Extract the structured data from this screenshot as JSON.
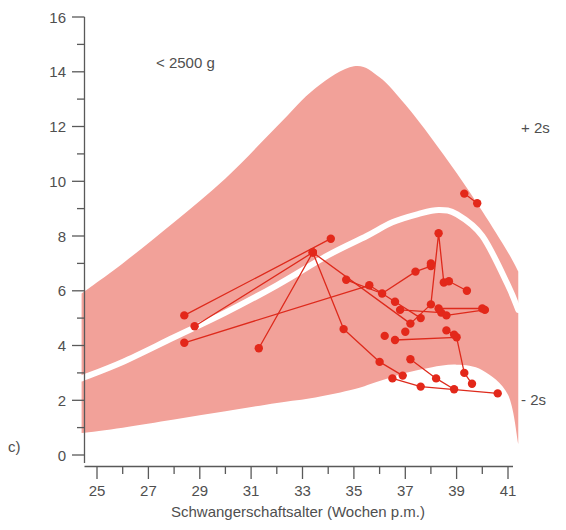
{
  "chart_data": {
    "type": "scatter",
    "title": "",
    "annotation_group_label": "< 2500 g",
    "panel_label": "c)",
    "xlabel": "Schwangerschaftsalter (Wochen p.m.)",
    "ylabel": "",
    "xlim": [
      24.2,
      41.6
    ],
    "ylim": [
      0,
      16
    ],
    "xticks": [
      25,
      26,
      27,
      28,
      29,
      30,
      31,
      32,
      33,
      34,
      35,
      36,
      37,
      38,
      39,
      40,
      41
    ],
    "xtick_labels": [
      "25",
      "",
      "27",
      "",
      "29",
      "",
      "31",
      "",
      "33",
      "",
      "35",
      "",
      "37",
      "",
      "39",
      "",
      "41"
    ],
    "yticks": [
      0,
      1,
      2,
      3,
      4,
      5,
      6,
      7,
      8,
      9,
      10,
      11,
      12,
      13,
      14,
      15,
      16
    ],
    "ytick_labels": [
      "0",
      "",
      "2",
      "",
      "4",
      "",
      "6",
      "",
      "8",
      "",
      "10",
      "",
      "12",
      "",
      "14",
      "",
      "16"
    ],
    "grid": false,
    "legend_position": "none",
    "band_color": "#f2a199",
    "mean_line_color": "#ffffff",
    "series_color": "#e3281a",
    "reference_band": {
      "name": "Normbereich (+2s / -2s)",
      "upper_label": "+ 2s",
      "lower_label": "- 2s",
      "x": [
        24.4,
        26.0,
        28.0,
        30.0,
        32.0,
        33.5,
        35.0,
        36.0,
        37.0,
        38.0,
        39.0,
        40.0,
        41.0,
        41.4
      ],
      "upper": [
        5.9,
        7.0,
        8.5,
        10.1,
        12.0,
        13.4,
        14.2,
        13.8,
        12.8,
        11.6,
        10.3,
        8.9,
        7.4,
        6.7
      ],
      "lower": [
        0.8,
        1.0,
        1.3,
        1.6,
        1.9,
        2.1,
        2.4,
        2.7,
        3.0,
        3.2,
        3.3,
        3.1,
        2.2,
        0.4
      ]
    },
    "mean_curve": {
      "name": "Mittelwert",
      "x": [
        24.4,
        26.0,
        28.0,
        30.0,
        32.0,
        34.0,
        35.5,
        36.5,
        37.5,
        38.3,
        39.0,
        40.0,
        41.0,
        41.4
      ],
      "y": [
        2.8,
        3.4,
        4.3,
        5.2,
        6.2,
        7.3,
        8.0,
        8.5,
        8.8,
        8.95,
        8.8,
        8.0,
        6.2,
        5.3
      ]
    },
    "series": [
      {
        "name": "patient-1",
        "points": [
          [
            28.4,
            5.1
          ],
          [
            34.1,
            7.9
          ]
        ]
      },
      {
        "name": "patient-2",
        "points": [
          [
            28.8,
            4.7
          ],
          [
            33.4,
            7.4
          ]
        ]
      },
      {
        "name": "patient-3",
        "points": [
          [
            28.4,
            4.1
          ],
          [
            35.6,
            6.2
          ],
          [
            36.6,
            5.6
          ],
          [
            37.6,
            5.0
          ]
        ]
      },
      {
        "name": "patient-4",
        "points": [
          [
            31.3,
            3.9
          ],
          [
            33.4,
            7.4
          ],
          [
            34.6,
            4.6
          ],
          [
            36.0,
            3.4
          ],
          [
            36.9,
            2.9
          ]
        ]
      },
      {
        "name": "patient-5",
        "points": [
          [
            33.4,
            7.4
          ],
          [
            37.2,
            4.8
          ],
          [
            38.0,
            5.5
          ],
          [
            38.3,
            8.1
          ],
          [
            38.5,
            6.3
          ]
        ]
      },
      {
        "name": "patient-6",
        "points": [
          [
            34.7,
            6.4
          ],
          [
            36.1,
            5.9
          ],
          [
            37.4,
            6.7
          ],
          [
            38.0,
            6.9
          ]
        ]
      },
      {
        "name": "patient-7",
        "points": [
          [
            36.8,
            5.3
          ],
          [
            38.4,
            5.2
          ],
          [
            38.6,
            5.1
          ],
          [
            40.1,
            5.3
          ]
        ]
      },
      {
        "name": "patient-8",
        "points": [
          [
            38.3,
            5.35
          ],
          [
            40.0,
            5.35
          ]
        ]
      },
      {
        "name": "patient-9",
        "points": [
          [
            36.6,
            4.2
          ],
          [
            39.0,
            4.3
          ],
          [
            39.3,
            3.0
          ],
          [
            39.6,
            2.6
          ]
        ]
      },
      {
        "name": "patient-10",
        "points": [
          [
            37.2,
            3.5
          ],
          [
            38.2,
            2.8
          ],
          [
            38.9,
            2.4
          ]
        ]
      },
      {
        "name": "patient-11",
        "points": [
          [
            36.5,
            2.8
          ],
          [
            37.6,
            2.5
          ],
          [
            40.6,
            2.25
          ]
        ]
      },
      {
        "name": "patient-12",
        "points": [
          [
            38.6,
            4.55
          ],
          [
            38.9,
            4.4
          ]
        ]
      },
      {
        "name": "patient-13",
        "points": [
          [
            39.3,
            9.55
          ],
          [
            39.8,
            9.2
          ]
        ]
      },
      {
        "name": "patient-14",
        "points": [
          [
            38.7,
            6.35
          ],
          [
            39.4,
            6.0
          ]
        ]
      }
    ],
    "extra_points": [
      [
        38.0,
        7.0
      ],
      [
        36.2,
        4.35
      ],
      [
        37.0,
        4.5
      ]
    ]
  }
}
